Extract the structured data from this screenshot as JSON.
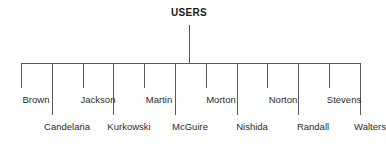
{
  "chart_data": {
    "type": "diagram",
    "diagram_kind": "organization-tree",
    "title": "USERS",
    "root": "USERS",
    "leaf_count": 12,
    "leaves": [
      {
        "label": "Brown",
        "row": "upper",
        "center_x": 36,
        "tick_x": 21
      },
      {
        "label": "Candelaria",
        "row": "lower",
        "center_x": 67,
        "tick_x": 52
      },
      {
        "label": "Jackson",
        "row": "upper",
        "center_x": 98,
        "tick_x": 83
      },
      {
        "label": "Kurkowski",
        "row": "lower",
        "center_x": 129,
        "tick_x": 113
      },
      {
        "label": "Martin",
        "row": "upper",
        "center_x": 159,
        "tick_x": 144
      },
      {
        "label": "McGuire",
        "row": "lower",
        "center_x": 190,
        "tick_x": 175
      },
      {
        "label": "Morton",
        "row": "upper",
        "center_x": 221,
        "tick_x": 206
      },
      {
        "label": "Nishida",
        "row": "lower",
        "center_x": 252,
        "tick_x": 237
      },
      {
        "label": "Norton",
        "row": "upper",
        "center_x": 283,
        "tick_x": 267
      },
      {
        "label": "Randall",
        "row": "lower",
        "center_x": 313,
        "tick_x": 298
      },
      {
        "label": "Stevens",
        "row": "upper",
        "center_x": 344,
        "tick_x": 329
      },
      {
        "label": "Walters",
        "row": "lower",
        "center_x": 370,
        "tick_x": 360
      }
    ],
    "geometry": {
      "hbar_y": 63,
      "hbar_x_start": 21,
      "hbar_x_end": 360,
      "root_stem_x": 189,
      "root_stem_top": 25,
      "root_stem_bottom": 63,
      "short_tick_bottom": 88,
      "long_tick_bottom": 115
    },
    "colors": {
      "line": "#5a5a5a",
      "text": "#2b2b2b",
      "root_text": "#1a1a1a",
      "background": "#ffffff"
    }
  }
}
